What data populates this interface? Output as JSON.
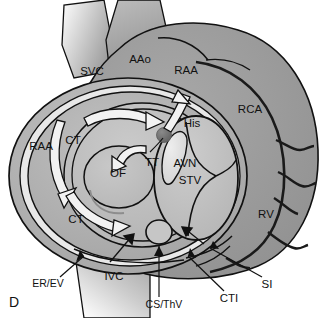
{
  "figure": {
    "panel_letter": "D",
    "type": "anatomical-diagram",
    "background_color": "#ffffff",
    "line_color": "#111111"
  },
  "labels": {
    "svc": "SVC",
    "aao": "AAo",
    "raa_top": "RAA",
    "rca": "RCA",
    "raa_left": "RAA",
    "ct_upper": "CT",
    "ct_lower": "CT",
    "of": "OF",
    "tt": "TT",
    "his": "His",
    "avn": "AVN",
    "stv": "STV",
    "rv": "RV",
    "er_ev": "ER/EV",
    "ivc": "IVC",
    "cs_thv": "CS/ThV",
    "cti": "CTI",
    "si": "SI"
  },
  "label_positions": {
    "svc": {
      "x": 92,
      "y": 72
    },
    "aao": {
      "x": 140,
      "y": 60
    },
    "raa_top": {
      "x": 186,
      "y": 71
    },
    "rca": {
      "x": 250,
      "y": 110
    },
    "raa_left": {
      "x": 41,
      "y": 147
    },
    "ct_upper": {
      "x": 73,
      "y": 141
    },
    "ct_lower": {
      "x": 76,
      "y": 220
    },
    "of": {
      "x": 118,
      "y": 174
    },
    "tt": {
      "x": 152,
      "y": 163
    },
    "his": {
      "x": 192,
      "y": 124
    },
    "avn": {
      "x": 185,
      "y": 164
    },
    "stv": {
      "x": 190,
      "y": 181
    },
    "rv": {
      "x": 266,
      "y": 215
    },
    "er_ev": {
      "x": 48,
      "y": 284
    },
    "ivc": {
      "x": 114,
      "y": 277
    },
    "cs_thv": {
      "x": 164,
      "y": 305
    },
    "cti": {
      "x": 229,
      "y": 299
    },
    "si": {
      "x": 267,
      "y": 285
    },
    "panel": {
      "x": 14,
      "y": 303
    }
  },
  "palette": {
    "tissue_mid": "#9b9b9b",
    "tissue_dark": "#8a8a8a",
    "tissue_light": "#b8b8b8",
    "chamber_light": "#c2c2c2",
    "chamber_pale": "#cfcfcf",
    "ring_white": "#efefef",
    "node_dark": "#6e6e6e",
    "avn_pale": "#dcdcdc",
    "outline": "#111111",
    "vessel_grad_start": "#9a9a9a",
    "vessel_grad_end": "#ffffff"
  },
  "structures": [
    {
      "name": "superior-vena-cava",
      "abbrev": "SVC"
    },
    {
      "name": "ascending-aorta",
      "abbrev": "AAo"
    },
    {
      "name": "right-atrial-appendage",
      "abbrev": "RAA"
    },
    {
      "name": "right-coronary-artery",
      "abbrev": "RCA"
    },
    {
      "name": "crista-terminalis",
      "abbrev": "CT"
    },
    {
      "name": "oval-fossa",
      "abbrev": "OF"
    },
    {
      "name": "tendon-of-todaro",
      "abbrev": "TT"
    },
    {
      "name": "bundle-of-his",
      "abbrev": "His"
    },
    {
      "name": "atrioventricular-node",
      "abbrev": "AVN"
    },
    {
      "name": "septal-tricuspid-valve",
      "abbrev": "STV"
    },
    {
      "name": "right-ventricle",
      "abbrev": "RV"
    },
    {
      "name": "eustachian-ridge-valve",
      "abbrev": "ER/EV"
    },
    {
      "name": "inferior-vena-cava",
      "abbrev": "IVC"
    },
    {
      "name": "coronary-sinus-thebesian-valve",
      "abbrev": "CS/ThV"
    },
    {
      "name": "cavotricuspid-isthmus",
      "abbrev": "CTI"
    },
    {
      "name": "sub-eustachian-isthmus",
      "abbrev": "SI"
    }
  ]
}
